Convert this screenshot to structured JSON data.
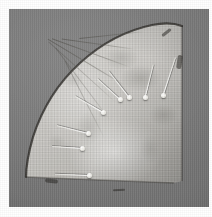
{
  "image": {
    "subject": "fan-leaf-textile-fragment",
    "description": "Quarter-circle pleated fan leaf pinned to a gray mounting board",
    "orientation": "pivot at lower right, arc sweeping to upper left",
    "board_color": "#7c7c7c",
    "mount_margin_color": "#ffffff",
    "leaf_color": "#cfccc4",
    "pin_head_color": "#ffffff",
    "rib_shadow_color": "#46443e"
  },
  "board": {
    "x": 9,
    "y": 9,
    "width": 200,
    "height": 198
  },
  "leaf": {
    "x": 15,
    "y": 12,
    "width": 162,
    "height": 168
  },
  "ribs": [
    {
      "name": "rib-1",
      "left": 70,
      "top": 22,
      "length": 66,
      "angle": -6
    },
    {
      "name": "rib-2",
      "left": 52,
      "top": 40,
      "length": 76,
      "angle": 8
    },
    {
      "name": "rib-3",
      "left": 38,
      "top": 58,
      "length": 84,
      "angle": 20
    },
    {
      "name": "rib-4",
      "left": 26,
      "top": 76,
      "length": 90,
      "angle": 31
    },
    {
      "name": "rib-5",
      "left": 16,
      "top": 94,
      "length": 92,
      "angle": 42
    },
    {
      "name": "rib-6",
      "left": 10,
      "top": 112,
      "length": 92,
      "angle": 53
    },
    {
      "name": "rib-7",
      "left": 8,
      "top": 130,
      "length": 88,
      "angle": 63
    }
  ],
  "pins": [
    {
      "name": "pin-1",
      "head_x": 152,
      "head_y": 84,
      "shaft_angle": -72,
      "shaft_length": 40
    },
    {
      "name": "pin-2",
      "head_x": 134,
      "head_y": 86,
      "shaft_angle": -76,
      "shaft_length": 34
    },
    {
      "name": "pin-3",
      "head_x": 118,
      "head_y": 86,
      "shaft_angle": -128,
      "shaft_length": 33
    },
    {
      "name": "pin-4",
      "head_x": 109,
      "head_y": 88,
      "shaft_angle": -138,
      "shaft_length": 30
    },
    {
      "name": "pin-5",
      "head_x": 92,
      "head_y": 101,
      "shaft_angle": -150,
      "shaft_length": 32
    },
    {
      "name": "pin-6",
      "head_x": 77,
      "head_y": 122,
      "shaft_angle": -166,
      "shaft_length": 32
    },
    {
      "name": "pin-7",
      "head_x": 71,
      "head_y": 137,
      "shaft_angle": -176,
      "shaft_length": 30
    },
    {
      "name": "pin-8",
      "head_x": 78,
      "head_y": 164,
      "shaft_angle": 182,
      "shaft_length": 34
    }
  ],
  "creases": [
    {
      "name": "crease-top-right",
      "left": 152,
      "top": 22,
      "width": 11,
      "height": 3,
      "angle": -38
    },
    {
      "name": "crease-right-edge",
      "left": 168,
      "top": 46,
      "width": 5,
      "height": 14,
      "angle": 8
    },
    {
      "name": "crease-bottom-left",
      "left": 36,
      "top": 170,
      "width": 13,
      "height": 4,
      "angle": 6
    },
    {
      "name": "crease-bottom-mid",
      "left": 104,
      "top": 180,
      "width": 12,
      "height": 2,
      "angle": -2
    }
  ]
}
